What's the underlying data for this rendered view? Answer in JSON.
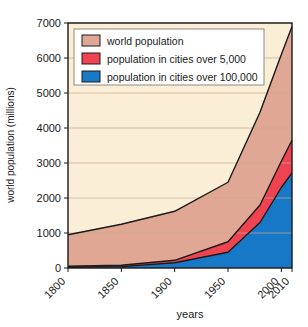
{
  "chart_data": {
    "type": "area",
    "title": "",
    "subtitle": "",
    "xlabel": "years",
    "ylabel": "world population (millions)",
    "xlim": [
      1800,
      2010
    ],
    "ylim": [
      0,
      7000
    ],
    "grid": true,
    "stacked": false,
    "legend_position": "top-left",
    "x": [
      1800,
      1850,
      1900,
      1950,
      1980,
      2000,
      2010
    ],
    "xticks": [
      1800,
      1850,
      1900,
      1950,
      2000,
      2010
    ],
    "xtick_labels": [
      "1800",
      "1850",
      "1900",
      "1950",
      "2000",
      "2010"
    ],
    "yticks": [
      0,
      1000,
      2000,
      3000,
      4000,
      5000,
      6000,
      7000
    ],
    "ytick_labels": [
      "0",
      "1000",
      "2000",
      "3000",
      "4000",
      "5000",
      "6000",
      "7000"
    ],
    "series": [
      {
        "name": "world population",
        "color": "#e0a894",
        "values": [
          950,
          1250,
          1620,
          2450,
          4450,
          6100,
          6900
        ]
      },
      {
        "name": "population in cities over 5,000",
        "color": "#ef4352",
        "values": [
          50,
          80,
          220,
          750,
          1800,
          3050,
          3650
        ]
      },
      {
        "name": "population in cities over 100,000",
        "color": "#1878c8",
        "values": [
          20,
          40,
          150,
          450,
          1300,
          2300,
          2720
        ]
      }
    ]
  },
  "legend": {
    "items": [
      {
        "label": "world population",
        "color": "#e0a894"
      },
      {
        "label": "population in cities over 5,000",
        "color": "#ef4352"
      },
      {
        "label": "population in cities over 100,000",
        "color": "#1878c8"
      }
    ]
  },
  "axes": {
    "y_title": "world population (millions)",
    "x_title": "years",
    "y_ticks": [
      "7000",
      "6000",
      "5000",
      "4000",
      "3000",
      "2000",
      "1000",
      "0"
    ],
    "x_ticks": [
      "1800",
      "1850",
      "1900",
      "1950",
      "2000",
      "2010"
    ]
  },
  "colors": {
    "plot_background": "#faefd6",
    "world_population": "#e0a894",
    "cities_over_5000": "#ef4352",
    "cities_over_100000": "#1878c8",
    "outline": "#1a1a1a",
    "gridline": "#c8a98c",
    "legend_background": "#ffffff"
  }
}
